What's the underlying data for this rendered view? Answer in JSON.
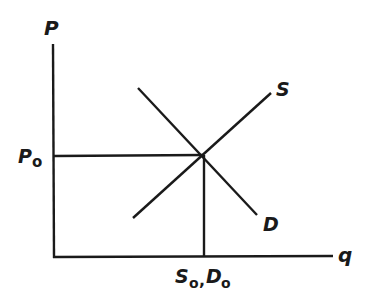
{
  "diagram": {
    "type": "supply-demand",
    "axes": {
      "y_label": "P",
      "x_label": "q"
    },
    "curves": {
      "supply_label": "S",
      "demand_label": "D"
    },
    "equilibrium": {
      "price_label_main": "P",
      "price_label_sub": "o",
      "quantity_label_s": "S",
      "quantity_label_s_sub": "o",
      "quantity_separator": ",",
      "quantity_label_d": "D",
      "quantity_label_d_sub": "o"
    },
    "color": "#1a1a1a"
  }
}
